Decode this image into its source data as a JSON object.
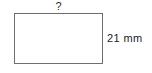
{
  "diagram": {
    "type": "rectangle-dimension-diagram",
    "shape": {
      "name": "rectangle",
      "fill_color": "#ffffff",
      "stroke_color": "#6e6e6e",
      "stroke_width_px": 1
    },
    "labels": {
      "width": {
        "text": "?",
        "position": "top",
        "meaning": "unknown-width",
        "color": "#2b2b2b"
      },
      "height": {
        "text": "21 mm",
        "value": 21,
        "unit": "mm",
        "position": "right",
        "meaning": "known-height",
        "color": "#1c1c1c"
      }
    },
    "background_color": "#ffffff"
  }
}
